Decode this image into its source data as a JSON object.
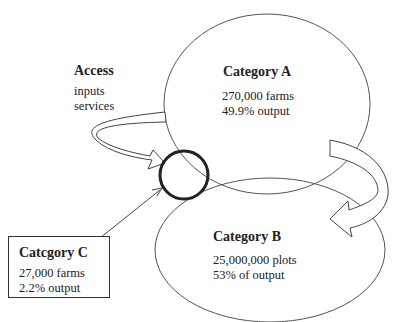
{
  "diagram": {
    "access": {
      "title": "Access",
      "lines": [
        "inputs",
        "services"
      ]
    },
    "category_a": {
      "title": "Category A",
      "farms": "270,000 farms",
      "output": "49.9% output"
    },
    "category_b": {
      "title": "Category B",
      "plots": "25,000,000 plots",
      "output": "53% of output"
    },
    "category_c": {
      "title": "Catcgory C",
      "farms": "27,000 farms",
      "output": "2.2% output"
    }
  }
}
